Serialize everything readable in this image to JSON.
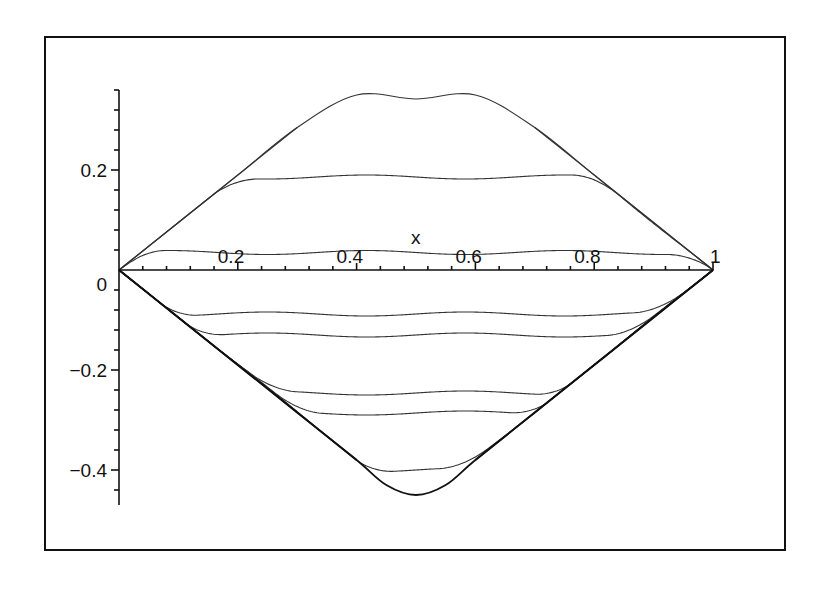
{
  "chart_data": {
    "type": "line",
    "title": "",
    "xlabel": "x",
    "ylabel": "",
    "xlim": [
      0,
      1
    ],
    "ylim": [
      -0.47,
      0.36
    ],
    "grid": false,
    "legend": null,
    "x_ticks": [
      {
        "value": 0.2,
        "label": "0.2"
      },
      {
        "value": 0.4,
        "label": "0.4"
      },
      {
        "value": 0.6,
        "label": "0.6"
      },
      {
        "value": 0.8,
        "label": "0.8"
      },
      {
        "value": 1.0,
        "label": "1"
      }
    ],
    "y_ticks": [
      {
        "value": 0.2,
        "label": "0.2"
      },
      {
        "value": 0.0,
        "label": "0"
      },
      {
        "value": -0.2,
        "label": "-0.2"
      },
      {
        "value": -0.4,
        "label": "-0.4"
      }
    ],
    "envelope_slope": 0.95,
    "series": [
      {
        "name": "curve-1",
        "sign": 1,
        "plateau": [
          [
            0.0,
            0.0
          ],
          [
            0.1,
            0.095
          ],
          [
            0.2,
            0.19
          ],
          [
            0.3,
            0.285
          ],
          [
            0.4,
            0.35
          ],
          [
            0.5,
            0.342
          ],
          [
            0.6,
            0.35
          ],
          [
            0.7,
            0.285
          ],
          [
            0.8,
            0.19
          ],
          [
            0.9,
            0.095
          ],
          [
            1.0,
            0.0
          ]
        ]
      },
      {
        "name": "curve-2",
        "sign": 1,
        "level": 0.186
      },
      {
        "name": "curve-3",
        "sign": 1,
        "level": 0.035
      },
      {
        "name": "curve-4",
        "sign": -1,
        "level": -0.088
      },
      {
        "name": "curve-5",
        "sign": -1,
        "level": -0.13
      },
      {
        "name": "curve-6",
        "sign": -1,
        "level": -0.246
      },
      {
        "name": "curve-7",
        "sign": -1,
        "level": -0.286
      },
      {
        "name": "curve-8",
        "sign": -1,
        "level": -0.4
      },
      {
        "name": "curve-9",
        "sign": -1,
        "plateau": [
          [
            0.0,
            0.0
          ],
          [
            0.1,
            -0.095
          ],
          [
            0.2,
            -0.19
          ],
          [
            0.3,
            -0.285
          ],
          [
            0.4,
            -0.38
          ],
          [
            0.45,
            -0.43
          ],
          [
            0.5,
            -0.45
          ],
          [
            0.55,
            -0.43
          ],
          [
            0.6,
            -0.38
          ],
          [
            0.7,
            -0.285
          ],
          [
            0.8,
            -0.19
          ],
          [
            0.9,
            -0.095
          ],
          [
            1.0,
            0.0
          ]
        ]
      }
    ]
  }
}
